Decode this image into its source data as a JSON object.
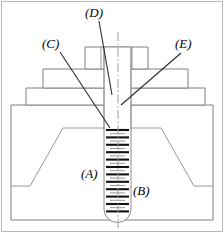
{
  "figure": {
    "background_color": "#ffffff",
    "line_color": "#808080",
    "leader_color": "#2b2b2b",
    "thread_color": "#111111",
    "centerline_color": "#9a9a9a"
  },
  "labels": [
    {
      "id": "A",
      "text": "(A)",
      "x": 81,
      "y": 178,
      "part": "threaded-shank",
      "has_leader": false
    },
    {
      "id": "B",
      "text": "(B)",
      "x": 133,
      "y": 195,
      "part": "thread-crest",
      "has_leader": false
    },
    {
      "id": "C",
      "text": "(C)",
      "x": 42,
      "y": 48,
      "part": "upper-washer-bore",
      "has_leader": true,
      "leader": "M 60 52 L 110 128"
    },
    {
      "id": "D",
      "text": "(D)",
      "x": 85,
      "y": 17,
      "part": "nut-bore",
      "has_leader": true,
      "leader": "M 99 21 L 112 95"
    },
    {
      "id": "E",
      "text": "(E)",
      "x": 175,
      "y": 48,
      "part": "shank-clearance",
      "has_leader": true,
      "leader": "M 181 53 L 121 105"
    }
  ],
  "geometry": {
    "frame": {
      "x": 1,
      "y": 1,
      "width": 222,
      "height": 231
    },
    "nut": {
      "x": 85,
      "y": 47,
      "width": 63,
      "height": 22,
      "division_lines_x": [
        101,
        132
      ]
    },
    "washer_mid": {
      "x": 43,
      "y": 69,
      "width": 145,
      "height": 20
    },
    "washer_low": {
      "x": 26,
      "y": 88,
      "width": 179,
      "height": 17
    },
    "base_block": {
      "x": 11,
      "y": 105,
      "width": 202,
      "height": 115
    },
    "void_trapezoid": {
      "top_left_x": 63,
      "top_right_x": 161,
      "bottom_left_x": 30,
      "bottom_right_x": 194,
      "top_y": 128,
      "bottom_y": 186
    },
    "shank": {
      "left_x": 104,
      "right_x": 131,
      "top_y": 88,
      "tip_y": 220,
      "tip_radius": 11
    },
    "centerline_x": 118,
    "thread": {
      "start_y": 130,
      "end_y": 214,
      "pitch": 7.4,
      "crest_inset": 2,
      "root_inset": 6
    }
  }
}
